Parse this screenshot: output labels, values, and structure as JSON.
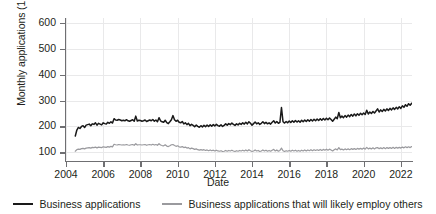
{
  "chart_data": {
    "type": "line",
    "title": "",
    "xlabel": "Date",
    "ylabel": "Monthly applications (1,000s)",
    "xlim": [
      2004,
      2022.6
    ],
    "ylim": [
      70,
      620
    ],
    "yticks": [
      100,
      200,
      300,
      400,
      500,
      600
    ],
    "ytick_labels": [
      "100",
      "200",
      "300",
      "400",
      "500",
      "600"
    ],
    "xticks": [
      2004,
      2006,
      2008,
      2010,
      2012,
      2014,
      2016,
      2018,
      2020,
      2022
    ],
    "xtick_labels": [
      "2004",
      "2006",
      "2008",
      "2010",
      "2012",
      "2014",
      "2016",
      "2018",
      "2020",
      "2022"
    ],
    "grid": true,
    "legend_position": "bottom",
    "series": [
      {
        "name": "Business applications",
        "color": "#1a1a1a",
        "x_start": 2004.5,
        "x_step": 0.0833333,
        "values": [
          163,
          186,
          196,
          192,
          200,
          203,
          196,
          205,
          207,
          209,
          203,
          210,
          208,
          214,
          205,
          212,
          209,
          206,
          214,
          211,
          209,
          216,
          212,
          218,
          213,
          230,
          225,
          224,
          227,
          225,
          222,
          224,
          222,
          226,
          222,
          220,
          223,
          226,
          220,
          240,
          221,
          224,
          223,
          220,
          222,
          225,
          219,
          222,
          225,
          222,
          227,
          220,
          225,
          218,
          234,
          222,
          218,
          216,
          224,
          215,
          211,
          218,
          226,
          242,
          226,
          220,
          224,
          216,
          214,
          219,
          210,
          214,
          207,
          212,
          203,
          208,
          204,
          199,
          205,
          200,
          197,
          203,
          198,
          204,
          199,
          205,
          200,
          206,
          201,
          207,
          202,
          208,
          203,
          201,
          206,
          200,
          204,
          210,
          205,
          211,
          207,
          213,
          208,
          204,
          210,
          206,
          212,
          208,
          214,
          209,
          216,
          210,
          218,
          212,
          205,
          211,
          217,
          210,
          214,
          208,
          212,
          218,
          211,
          216,
          210,
          214,
          209,
          216,
          222,
          213,
          219,
          212,
          216,
          273,
          218,
          213,
          219,
          214,
          221,
          215,
          222,
          216,
          223,
          217,
          222,
          216,
          224,
          218,
          225,
          219,
          226,
          220,
          227,
          221,
          228,
          222,
          229,
          223,
          230,
          224,
          231,
          225,
          232,
          226,
          233,
          227,
          220,
          228,
          236,
          230,
          254,
          234,
          240,
          234,
          242,
          236,
          244,
          238,
          246,
          240,
          248,
          241,
          249,
          243,
          251,
          245,
          252,
          246,
          263,
          248,
          256,
          250,
          258,
          252,
          260,
          268,
          256,
          264,
          258,
          266,
          260,
          268,
          262,
          270,
          264,
          272,
          266,
          274,
          268,
          276,
          270,
          280,
          274,
          284,
          278,
          288,
          282,
          290,
          285,
          293,
          287,
          295,
          289,
          297,
          291,
          288,
          294,
          286,
          292,
          288,
          296,
          290,
          298,
          292,
          300,
          294,
          302,
          296,
          304,
          298,
          283,
          245,
          232,
          308,
          395,
          555,
          478,
          432,
          383,
          348,
          470,
          452,
          437,
          498,
          466,
          452,
          444,
          438,
          434,
          430,
          427,
          424,
          421,
          419,
          421,
          423,
          425,
          418,
          414,
          412,
          410
        ]
      },
      {
        "name": "Business applications that will likely employ others",
        "color": "#9a9a9e",
        "x_start": 2004.5,
        "x_step": 0.0833333,
        "values": [
          104,
          110,
          112,
          111,
          114,
          115,
          113,
          116,
          117,
          118,
          116,
          119,
          118,
          120,
          117,
          120,
          119,
          118,
          121,
          120,
          119,
          122,
          120,
          123,
          121,
          131,
          129,
          128,
          130,
          129,
          128,
          129,
          128,
          130,
          128,
          127,
          129,
          130,
          127,
          133,
          128,
          129,
          129,
          128,
          129,
          130,
          127,
          129,
          130,
          128,
          131,
          128,
          130,
          127,
          133,
          128,
          126,
          125,
          129,
          124,
          122,
          125,
          129,
          130,
          126,
          123,
          125,
          121,
          120,
          122,
          118,
          120,
          116,
          118,
          113,
          116,
          114,
          111,
          113,
          110,
          108,
          110,
          108,
          110,
          107,
          109,
          106,
          109,
          106,
          108,
          105,
          108,
          105,
          104,
          106,
          103,
          104,
          107,
          104,
          107,
          105,
          108,
          105,
          103,
          106,
          104,
          107,
          105,
          108,
          105,
          109,
          105,
          110,
          106,
          103,
          105,
          109,
          105,
          107,
          103,
          105,
          109,
          105,
          108,
          104,
          107,
          104,
          108,
          111,
          105,
          109,
          104,
          107,
          116,
          106,
          103,
          106,
          104,
          107,
          104,
          108,
          105,
          108,
          104,
          107,
          104,
          108,
          105,
          109,
          105,
          109,
          106,
          110,
          106,
          110,
          107,
          110,
          107,
          111,
          107,
          111,
          108,
          112,
          108,
          112,
          109,
          105,
          110,
          113,
          109,
          118,
          110,
          112,
          109,
          113,
          110,
          113,
          110,
          114,
          111,
          114,
          111,
          115,
          112,
          115,
          112,
          116,
          112,
          119,
          113,
          116,
          113,
          117,
          113,
          117,
          118,
          114,
          117,
          114,
          118,
          114,
          118,
          115,
          118,
          115,
          119,
          115,
          119,
          116,
          119,
          116,
          120,
          117,
          121,
          118,
          121,
          118,
          122,
          119,
          122,
          119,
          123,
          119,
          123,
          120,
          118,
          121,
          117,
          120,
          118,
          122,
          118,
          122,
          119,
          123,
          119,
          123,
          120,
          124,
          120,
          113,
          96,
          82,
          118,
          145,
          175,
          152,
          143,
          131,
          126,
          156,
          150,
          144,
          158,
          150,
          146,
          144,
          142,
          140,
          139,
          138,
          137,
          136,
          136,
          137,
          138,
          139,
          137,
          136,
          135,
          135
        ]
      }
    ]
  },
  "axes": {
    "ylabel": "Monthly applications (1,000s)",
    "xlabel": "Date"
  },
  "legend": {
    "items": [
      {
        "label": "Business applications",
        "color": "#1a1a1a"
      },
      {
        "label": "Business applications that will likely employ others",
        "color": "#9a9a9e"
      }
    ]
  }
}
